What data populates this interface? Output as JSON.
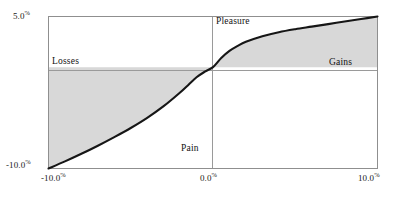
{
  "chart_data": {
    "type": "line",
    "title": "",
    "subtitle": "",
    "xlabel": "",
    "ylabel": "",
    "xlim": [
      -10.0,
      10.0
    ],
    "ylim": [
      -10.0,
      5.0
    ],
    "grid": false,
    "legend": "none",
    "x_ticks": [
      "-10.0%",
      "0.0%",
      "10.0%"
    ],
    "x_tick_values": [
      -10.0,
      0.0,
      10.0
    ],
    "y_ticks": [
      "5.0%",
      "-10.0%"
    ],
    "y_tick_values": [
      5.0,
      -10.0
    ],
    "zero_lines": {
      "x": 0.0,
      "y": 0.0
    },
    "series": [
      {
        "name": "value-function",
        "x": [
          -10.0,
          -9.0,
          -8.0,
          -7.0,
          -6.0,
          -5.0,
          -4.0,
          -3.0,
          -2.0,
          -1.5,
          -1.0,
          -0.5,
          0.0,
          0.5,
          1.0,
          1.5,
          2.0,
          3.0,
          4.0,
          5.0,
          6.0,
          7.0,
          8.0,
          9.0,
          10.0
        ],
        "y": [
          -10.0,
          -9.3,
          -8.55,
          -7.75,
          -6.9,
          -6.0,
          -5.0,
          -3.85,
          -2.5,
          -1.75,
          -1.0,
          -0.45,
          0.0,
          0.9,
          1.6,
          2.1,
          2.5,
          3.05,
          3.45,
          3.75,
          4.0,
          4.25,
          4.5,
          4.75,
          5.0
        ]
      }
    ],
    "shaded_regions": [
      {
        "name": "loss-area",
        "from_x": -10.0,
        "to_x": 0.0,
        "between": "curve-and-zero-line"
      },
      {
        "name": "gain-area",
        "from_x": 0.0,
        "to_x": 10.0,
        "between": "curve-and-zero-line"
      }
    ],
    "annotations": [
      {
        "name": "losses",
        "text": "Losses",
        "x": -9.5,
        "y": 0.55,
        "align": "left"
      },
      {
        "name": "gains",
        "text": "Gains",
        "x": 9.5,
        "y": 0.55,
        "align": "right"
      },
      {
        "name": "pleasure",
        "text": "Pleasure",
        "x": 0.3,
        "y": 4.6,
        "align": "left"
      },
      {
        "name": "pain",
        "text": "Pain",
        "x": -0.3,
        "y": -8.6,
        "align": "right"
      }
    ],
    "colors": {
      "curve": "#161616",
      "fill": "#d8d8d8",
      "axis": "#9a9a9a",
      "frame": "#8f8f8f",
      "text": "#111111",
      "background": "#ffffff"
    }
  },
  "axis": {
    "y_top_value": "5.0",
    "y_top_unit": "%",
    "y_bottom_value": "-10.0",
    "y_bottom_unit": "%",
    "x_left_value": "-10.0",
    "x_left_unit": "%",
    "x_mid_value": "0.0",
    "x_mid_unit": "%",
    "x_right_value": "10.0",
    "x_right_unit": "%"
  },
  "labels": {
    "losses": "Losses",
    "gains": "Gains",
    "pleasure": "Pleasure",
    "pain": "Pain"
  }
}
